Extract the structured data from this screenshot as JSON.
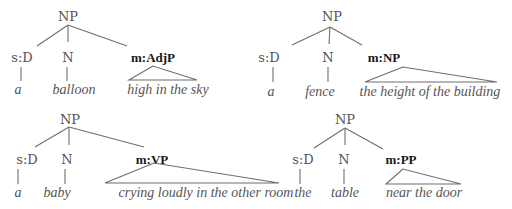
{
  "trees": [
    {
      "root": "NP",
      "determiner": {
        "label": "s:D",
        "word": "a"
      },
      "head": {
        "label": "N",
        "word": "balloon"
      },
      "modifier": {
        "label": "m:AdjP",
        "words": "high in the sky"
      }
    },
    {
      "root": "NP",
      "determiner": {
        "label": "s:D",
        "word": "a"
      },
      "head": {
        "label": "N",
        "word": "fence"
      },
      "modifier": {
        "label": "m:NP",
        "words": "the height of the building"
      }
    },
    {
      "root": "NP",
      "determiner": {
        "label": "s:D",
        "word": "a"
      },
      "head": {
        "label": "N",
        "word": "baby"
      },
      "modifier": {
        "label": "m:VP",
        "words": "crying loudly in the other room"
      }
    },
    {
      "root": "NP",
      "determiner": {
        "label": "s:D",
        "word": "the"
      },
      "head": {
        "label": "N",
        "word": "table"
      },
      "modifier": {
        "label": "m:PP",
        "words": "near the door"
      }
    }
  ]
}
